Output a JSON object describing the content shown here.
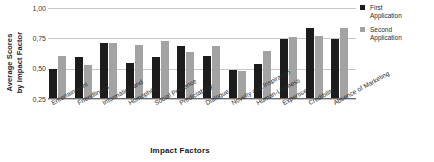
{
  "chart_data": {
    "type": "bar",
    "title": "",
    "xlabel": "Impact Factors",
    "ylabel": "Average Scores\nby Impact Factor",
    "ylim": [
      0.25,
      1.0
    ],
    "ytick_labels": [
      "1,00",
      "0,75",
      "0,50",
      "0,25"
    ],
    "ytick_values": [
      1.0,
      0.75,
      0.5,
      0.25
    ],
    "grid": true,
    "legend_position": "right",
    "categories": [
      "Entertainment",
      "Friendliness",
      "Information and",
      "Homophily",
      "Social Presence",
      "Predictability",
      "Dialogue",
      "Novelty and Inspiration",
      "Human-Likeness",
      "Expertise",
      "Credibility",
      "Absence of Marketing"
    ],
    "series": [
      {
        "name": "First Application",
        "color": "#1c1c1c",
        "values": [
          0.49,
          0.59,
          0.7,
          0.54,
          0.59,
          0.68,
          0.6,
          0.48,
          0.53,
          0.74,
          0.83,
          0.74
        ]
      },
      {
        "name": "Second Application",
        "color": "#a3a3a3",
        "values": [
          0.6,
          0.52,
          0.7,
          0.69,
          0.72,
          0.63,
          0.68,
          0.47,
          0.64,
          0.75,
          0.76,
          0.83
        ]
      }
    ]
  },
  "legend": {
    "entries": [
      {
        "label": "First\nApplication",
        "color": "#1c1c1c"
      },
      {
        "label": "Second\nApplication",
        "color": "#a3a3a3"
      }
    ]
  }
}
